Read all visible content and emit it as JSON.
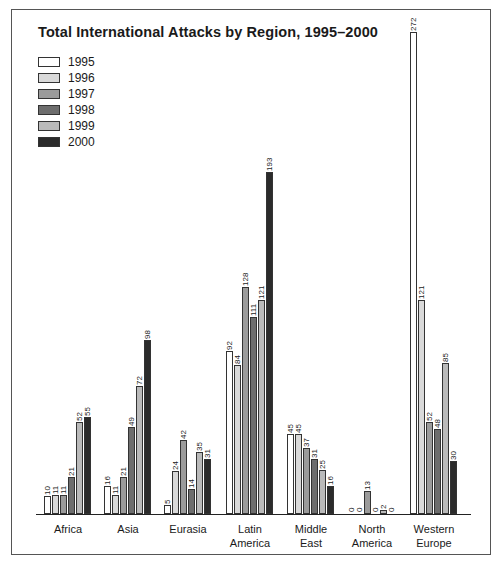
{
  "chart_data": {
    "type": "bar",
    "title": "Total International Attacks by Region, 1995–2000",
    "xlabel": "",
    "ylabel": "",
    "categories": [
      "Africa",
      "Asia",
      "Eurasia",
      "Latin America",
      "Middle East",
      "North America",
      "Western Europe"
    ],
    "category_lines": [
      [
        "Africa"
      ],
      [
        "Asia"
      ],
      [
        "Eurasia"
      ],
      [
        "Latin",
        "America"
      ],
      [
        "Middle",
        "East"
      ],
      [
        "North",
        "America"
      ],
      [
        "Western",
        "Europe"
      ]
    ],
    "series": [
      {
        "name": "1995",
        "color": "#ffffff",
        "values": [
          10,
          16,
          5,
          92,
          45,
          0,
          272
        ]
      },
      {
        "name": "1996",
        "color": "#d9d9d9",
        "values": [
          11,
          11,
          24,
          84,
          45,
          0,
          121
        ]
      },
      {
        "name": "1997",
        "color": "#9b9b9b",
        "values": [
          11,
          21,
          42,
          128,
          37,
          13,
          52
        ]
      },
      {
        "name": "1998",
        "color": "#6d6d6d",
        "values": [
          21,
          49,
          14,
          111,
          31,
          0,
          48
        ]
      },
      {
        "name": "1999",
        "color": "#bababa",
        "values": [
          52,
          72,
          35,
          121,
          25,
          2,
          85
        ]
      },
      {
        "name": "2000",
        "color": "#2b2b2b",
        "values": [
          55,
          98,
          31,
          193,
          16,
          0,
          30
        ]
      }
    ],
    "ylim": [
      0,
      272
    ],
    "grid": false,
    "legend_position": "top-left",
    "data_labels": true
  }
}
